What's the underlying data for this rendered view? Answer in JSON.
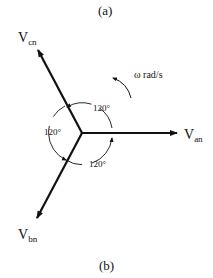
{
  "captions": {
    "top": "(a)",
    "bottom": "(b)"
  },
  "phasors": [
    {
      "name": "V",
      "sub": "an",
      "angle_deg": 0
    },
    {
      "name": "V",
      "sub": "bn",
      "angle_deg": -120
    },
    {
      "name": "V",
      "sub": "cn",
      "angle_deg": 120
    }
  ],
  "angles": [
    "120°",
    "120°",
    "120°"
  ],
  "rotation": {
    "label": "ω rad/s"
  },
  "colors": {
    "stroke": "#111111",
    "background": "#ffffff"
  }
}
